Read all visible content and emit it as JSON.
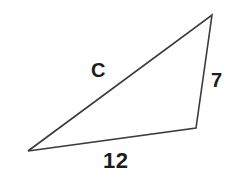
{
  "figure": {
    "type": "triangle-diagram",
    "background_color": "#ffffff",
    "stroke_color": "#3a3a42",
    "label_color": "#1c1c1c"
  },
  "labels": {
    "hypotenuse": "C",
    "vertical_side": "7",
    "base": "12"
  },
  "geometry": {
    "vertices": {
      "left": [
        28,
        151
      ],
      "apex": [
        212,
        15
      ],
      "bottom_right": [
        196,
        128
      ]
    },
    "sides": [
      {
        "name": "hypotenuse",
        "from": "left",
        "to": "apex",
        "label": "C"
      },
      {
        "name": "vertical",
        "from": "apex",
        "to": "bottom_right",
        "label": "7"
      },
      {
        "name": "base",
        "from": "bottom_right",
        "to": "left",
        "label": "12"
      }
    ]
  }
}
